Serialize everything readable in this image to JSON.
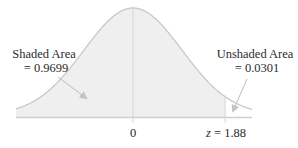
{
  "chart_data": {
    "type": "area",
    "title": "",
    "distribution": "standard normal",
    "mean": 0,
    "z_value": 1.88,
    "x_ticks": [
      {
        "value": 0,
        "label": "0"
      },
      {
        "value": 1.88,
        "label_var": "z",
        "label_eq": " = 1.88"
      }
    ],
    "shaded_region": {
      "from": "-inf",
      "to": 1.88,
      "area": 0.9699
    },
    "unshaded_region": {
      "from": 1.88,
      "to": "inf",
      "area": 0.0301
    },
    "annotations": {
      "shaded": {
        "line1": "Shaded Area",
        "line2": "= 0.9699"
      },
      "unshaded": {
        "line1": "Unshaded Area",
        "line2": "= 0.0301"
      }
    },
    "xlim": [
      -3.2,
      3.2
    ]
  },
  "colors": {
    "shaded_fill": "#efefef",
    "curve": "#c8c8c8",
    "axis": "#cfcfcf",
    "arrow": "#bdbdbd",
    "text": "#2b2b2b"
  }
}
